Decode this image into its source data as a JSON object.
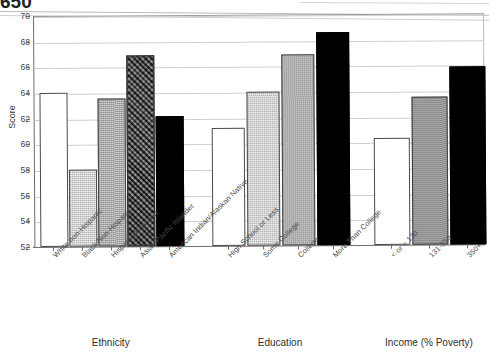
{
  "artifact": {
    "clipped_top_text": "650"
  },
  "chart_data": {
    "type": "bar",
    "title": "",
    "xlabel": "",
    "ylabel": "Score",
    "ylim": [
      52,
      70
    ],
    "yticks": [
      52,
      54,
      56,
      58,
      60,
      62,
      64,
      66,
      68,
      70
    ],
    "grid": true,
    "legend": "none",
    "groups": [
      {
        "name": "Ethnicity",
        "categories": [
          "White non-Hispanic",
          "Black Non-Hispanic",
          "Hispanic American",
          "Asian/Pacific Islander",
          "American Indian/Alaskan Native"
        ],
        "values": [
          64.0,
          58.0,
          63.5,
          66.9,
          62.1
        ],
        "fills": [
          "white",
          "light-gray",
          "medium-gray",
          "dark-hatched",
          "black"
        ]
      },
      {
        "name": "Education",
        "categories": [
          "High School or Less",
          "Some College",
          "College",
          "More Than College"
        ],
        "values": [
          61.2,
          64.0,
          66.9,
          68.6
        ],
        "fills": [
          "white",
          "light-gray",
          "medium-gray",
          "black"
        ]
      },
      {
        "name": "Income (% Poverty)",
        "categories": [
          "< or = 130",
          "131-350",
          "350+"
        ],
        "values": [
          60.3,
          63.5,
          65.9
        ],
        "fills": [
          "white",
          "gray",
          "black"
        ]
      }
    ]
  },
  "colors": {
    "white_fill": "#ffffff",
    "light_gray_fill": "#d2d2d2",
    "medium_gray_fill": "#a9a9a9",
    "gray_fill": "#8c8c8c",
    "dark_hatched_fill": "#4e4e4e",
    "black_fill": "#000000",
    "gridline": "#cfcfcf",
    "axis": "#6e6e6e"
  }
}
